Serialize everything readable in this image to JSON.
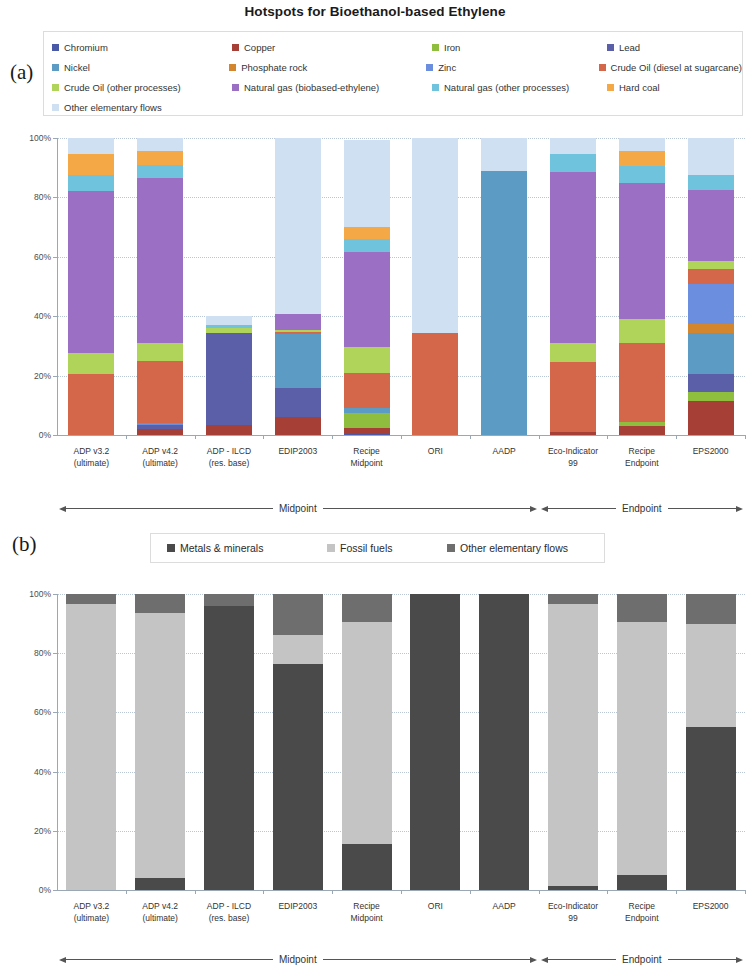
{
  "title": "Hotspots for Bioethanol-based Ethylene",
  "panels": {
    "a_tag": "(a)",
    "b_tag": "(b)"
  },
  "legend_a": {
    "items": [
      {
        "label": "Chromium",
        "color": "#4a58a8"
      },
      {
        "label": "Copper",
        "color": "#a63f35"
      },
      {
        "label": "Iron",
        "color": "#8fbe3f"
      },
      {
        "label": "Lead",
        "color": "#5a5fa8"
      },
      {
        "label": "Nickel",
        "color": "#5b9bc4"
      },
      {
        "label": "Phosphate rock",
        "color": "#d4862f"
      },
      {
        "label": "Zinc",
        "color": "#6b8ede"
      },
      {
        "label": "Crude Oil (diesel at sugarcane)",
        "color": "#d4674a"
      },
      {
        "label": "Crude Oil (other processes)",
        "color": "#b0d45a"
      },
      {
        "label": "Natural gas (biobased-ethylene)",
        "color": "#9b6fc4"
      },
      {
        "label": "Natural gas (other processes)",
        "color": "#6fc3dd"
      },
      {
        "label": "Hard coal",
        "color": "#f5a846"
      },
      {
        "label": "Other elementary flows",
        "color": "#cfe0f2"
      }
    ]
  },
  "legend_b": {
    "items": [
      {
        "label": "Metals & minerals",
        "color": "#4a4a4a"
      },
      {
        "label": "Fossil fuels",
        "color": "#c4c4c4"
      },
      {
        "label": "Other elementary flows",
        "color": "#6e6e6e"
      }
    ]
  },
  "groups": {
    "midpoint": "Midpoint",
    "endpoint": "Endpoint"
  },
  "chart_data": [
    {
      "type": "bar",
      "panel": "a",
      "stacked": true,
      "stacked_pct": true,
      "title": "Hotspots for Bioethanol-based Ethylene",
      "xlabel": "",
      "ylabel": "",
      "ylim": [
        0,
        100
      ],
      "yticks": [
        0,
        20,
        40,
        60,
        80,
        100
      ],
      "ytick_labels": [
        "0%",
        "20%",
        "40%",
        "60%",
        "80%",
        "100%"
      ],
      "grid": true,
      "legend_position": "top",
      "categories": [
        "ADP v3.2 (ultimate)",
        "ADP v4.2 (ultimate)",
        "ADP - ILCD (res. base)",
        "EDIP2003",
        "Recipe Midpoint",
        "ORI",
        "AADP",
        "Eco-Indicator 99",
        "Recipe Endpoint",
        "EPS2000"
      ],
      "category_lines": [
        [
          "ADP v3.2",
          "(ultimate)"
        ],
        [
          "ADP v4.2",
          "(ultimate)"
        ],
        [
          "ADP - ILCD",
          "(res. base)"
        ],
        [
          "EDIP2003",
          ""
        ],
        [
          "Recipe",
          "Midpoint"
        ],
        [
          "ORI",
          ""
        ],
        [
          "AADP",
          ""
        ],
        [
          "Eco-Indicator",
          "99"
        ],
        [
          "Recipe",
          "Endpoint"
        ],
        [
          "EPS2000",
          ""
        ]
      ],
      "group_spans": [
        {
          "label": "Midpoint",
          "from": 0,
          "to": 6
        },
        {
          "label": "Endpoint",
          "from": 7,
          "to": 9
        }
      ],
      "series": [
        {
          "name": "Chromium",
          "color": "#4a58a8",
          "values": [
            0,
            0,
            0,
            0,
            0.5,
            0,
            0,
            0,
            0,
            0
          ]
        },
        {
          "name": "Copper",
          "color": "#a63f35",
          "values": [
            0,
            2.0,
            3.5,
            6.0,
            2.0,
            0,
            0,
            1.0,
            3.0,
            11.5
          ]
        },
        {
          "name": "Iron",
          "color": "#8fbe3f",
          "values": [
            0,
            0,
            0,
            0,
            5.0,
            0,
            0,
            0,
            1.5,
            3.0
          ]
        },
        {
          "name": "Lead",
          "color": "#5a5fa8",
          "values": [
            0,
            1.5,
            31.0,
            10.0,
            0,
            0,
            0,
            0,
            0,
            6.0
          ]
        },
        {
          "name": "Nickel",
          "color": "#5b9bc4",
          "values": [
            0,
            0,
            0,
            18.0,
            1.5,
            0,
            89.0,
            0,
            0,
            14.0
          ]
        },
        {
          "name": "Phosphate rock",
          "color": "#d4862f",
          "values": [
            0,
            0,
            0,
            0,
            0,
            0,
            0,
            0,
            0,
            3.0
          ]
        },
        {
          "name": "Zinc",
          "color": "#6b8ede",
          "values": [
            0,
            0.5,
            0,
            0,
            0,
            0,
            0,
            0,
            0,
            13.5
          ]
        },
        {
          "name": "Crude Oil (diesel at sugarcane)",
          "color": "#d4674a",
          "values": [
            20.5,
            21.0,
            0,
            0.8,
            12.0,
            34.5,
            0,
            23.5,
            26.5,
            5.0
          ]
        },
        {
          "name": "Crude Oil (other processes)",
          "color": "#b0d45a",
          "values": [
            7.0,
            6.0,
            1.5,
            0.6,
            8.5,
            0,
            0,
            6.5,
            8.0,
            2.5
          ]
        },
        {
          "name": "Natural gas (biobased-ethylene)",
          "color": "#9b6fc4",
          "values": [
            54.5,
            55.5,
            0,
            5.5,
            32.0,
            0,
            0,
            57.5,
            46.0,
            24.0
          ]
        },
        {
          "name": "Natural gas (other processes)",
          "color": "#6fc3dd",
          "values": [
            5.5,
            4.5,
            1.0,
            0,
            4.5,
            0,
            0,
            6.0,
            5.5,
            5.0
          ]
        },
        {
          "name": "Hard coal",
          "color": "#f5a846",
          "values": [
            7.0,
            4.5,
            0,
            0,
            4.0,
            0,
            0,
            0,
            5.0,
            0
          ]
        },
        {
          "name": "Other elementary flows",
          "color": "#cfe0f2",
          "values": [
            5.5,
            4.5,
            3.0,
            59.1,
            29.5,
            65.5,
            11.0,
            5.5,
            4.5,
            12.5
          ]
        }
      ]
    },
    {
      "type": "bar",
      "panel": "b",
      "stacked": true,
      "stacked_pct": true,
      "title": "",
      "xlabel": "",
      "ylabel": "",
      "ylim": [
        0,
        100
      ],
      "yticks": [
        0,
        20,
        40,
        60,
        80,
        100
      ],
      "ytick_labels": [
        "0%",
        "20%",
        "40%",
        "60%",
        "80%",
        "100%"
      ],
      "grid": true,
      "legend_position": "top",
      "categories": [
        "ADP v3.2 (ultimate)",
        "ADP v4.2 (ultimate)",
        "ADP - ILCD (res. base)",
        "EDIP2003",
        "Recipe Midpoint",
        "ORI",
        "AADP",
        "Eco-Indicator 99",
        "Recipe Endpoint",
        "EPS2000"
      ],
      "category_lines": [
        [
          "ADP v3.2",
          "(ultimate)"
        ],
        [
          "ADP v4.2",
          "(ultimate)"
        ],
        [
          "ADP - ILCD",
          "(res. base)"
        ],
        [
          "EDIP2003",
          ""
        ],
        [
          "Recipe",
          "Midpoint"
        ],
        [
          "ORI",
          ""
        ],
        [
          "AADP",
          ""
        ],
        [
          "Eco-Indicator",
          "99"
        ],
        [
          "Recipe",
          "Endpoint"
        ],
        [
          "EPS2000",
          ""
        ]
      ],
      "group_spans": [
        {
          "label": "Midpoint",
          "from": 0,
          "to": 6
        },
        {
          "label": "Endpoint",
          "from": 7,
          "to": 9
        }
      ],
      "series": [
        {
          "name": "Metals & minerals",
          "color": "#4a4a4a",
          "values": [
            0,
            4.0,
            96.0,
            76.5,
            15.5,
            100.0,
            100.0,
            1.5,
            5.0,
            55.0
          ]
        },
        {
          "name": "Fossil fuels",
          "color": "#c4c4c4",
          "values": [
            96.5,
            89.5,
            0,
            9.5,
            75.0,
            0,
            0,
            95.0,
            85.5,
            35.0
          ]
        },
        {
          "name": "Other elementary flows",
          "color": "#6e6e6e",
          "values": [
            3.5,
            6.5,
            4.0,
            14.0,
            9.5,
            0,
            0,
            3.5,
            9.5,
            10.0
          ]
        }
      ]
    }
  ]
}
